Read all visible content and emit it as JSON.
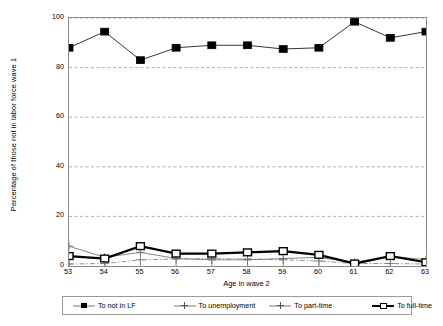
{
  "chart_data": {
    "type": "line",
    "title": "",
    "xlabel": "Age in wave 2",
    "ylabel": "Percentage of those not in labor force wave 1",
    "x": [
      53,
      54,
      55,
      56,
      57,
      58,
      59,
      60,
      61,
      62,
      63
    ],
    "xtick_labels": [
      "53",
      "54",
      "55",
      "56",
      "57",
      "58",
      "59",
      "60",
      "61",
      "62",
      "63"
    ],
    "ytick_labels": [
      "0",
      "20",
      "40",
      "60",
      "80",
      "100"
    ],
    "yticks": [
      0,
      20,
      40,
      60,
      80,
      100
    ],
    "ylim": [
      0,
      100
    ],
    "xlim": [
      53,
      63
    ],
    "grid": "horizontal-dashed",
    "legend_position": "bottom",
    "series": [
      {
        "name": "To not in LF",
        "marker": "filled-square",
        "color": "#000000",
        "line_width": 0.8,
        "values": [
          88,
          94.5,
          83,
          88,
          89,
          89,
          87.5,
          88,
          98.5,
          92,
          94.5
        ]
      },
      {
        "name": "To unemployment",
        "marker": "plus",
        "color": "#666666",
        "line_width": 0.8,
        "values": [
          8,
          3.5,
          5.5,
          3,
          2.5,
          2.5,
          3,
          3.5,
          1.5,
          4,
          2.5
        ]
      },
      {
        "name": "To part-time",
        "marker": "plus",
        "color": "#777777",
        "line_width": 0.8,
        "values": [
          0.8,
          1,
          2.5,
          2.8,
          3,
          2.8,
          2.5,
          2,
          1,
          1,
          0.8
        ]
      },
      {
        "name": "To full-time",
        "marker": "open-square",
        "color": "#000000",
        "line_width": 2.2,
        "values": [
          4,
          3,
          8,
          5,
          5,
          5.5,
          6,
          4.5,
          1,
          4,
          1.5
        ]
      }
    ]
  },
  "legend": {
    "items": [
      {
        "label": "To not in LF",
        "symbol": "filled-square-line"
      },
      {
        "label": "To unemployment",
        "symbol": "plus-line"
      },
      {
        "label": "To part-time",
        "symbol": "plus-line"
      },
      {
        "label": "To full-time",
        "symbol": "open-square-bold-line"
      }
    ]
  }
}
